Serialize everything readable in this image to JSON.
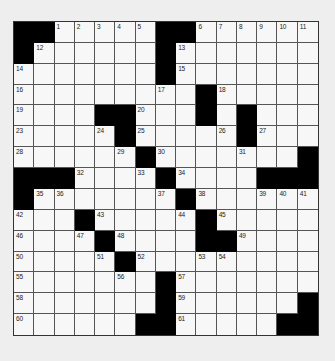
{
  "puzzle": {
    "rows": 15,
    "cols": 15,
    "colors": {
      "block": "#000000",
      "cell": "#f7f7f7",
      "line": "#555555",
      "background": "#eeeeee"
    },
    "grid": [
      "##.....##......",
      "#......#.......",
      ".......#.......",
      ".........#.....",
      "....##...#.#...",
      ".....#.....#...",
      "......#.......#",
      "###....#....###",
      "#.......#......",
      "...#.....#.....",
      "....#....##....",
      ".....#.........",
      ".......#.......",
      ".......#......#",
      "......##.....##"
    ],
    "numbers": [
      {
        "r": 0,
        "c": 2,
        "n": "1"
      },
      {
        "r": 0,
        "c": 3,
        "n": "2"
      },
      {
        "r": 0,
        "c": 4,
        "n": "3"
      },
      {
        "r": 0,
        "c": 5,
        "n": "4"
      },
      {
        "r": 0,
        "c": 6,
        "n": "5"
      },
      {
        "r": 0,
        "c": 9,
        "n": "6"
      },
      {
        "r": 0,
        "c": 10,
        "n": "7"
      },
      {
        "r": 0,
        "c": 11,
        "n": "8"
      },
      {
        "r": 0,
        "c": 12,
        "n": "9"
      },
      {
        "r": 0,
        "c": 13,
        "n": "10"
      },
      {
        "r": 0,
        "c": 14,
        "n": "11"
      },
      {
        "r": 1,
        "c": 1,
        "n": "12"
      },
      {
        "r": 1,
        "c": 8,
        "n": "13"
      },
      {
        "r": 2,
        "c": 0,
        "n": "14"
      },
      {
        "r": 2,
        "c": 8,
        "n": "15"
      },
      {
        "r": 3,
        "c": 0,
        "n": "16"
      },
      {
        "r": 3,
        "c": 7,
        "n": "17"
      },
      {
        "r": 3,
        "c": 10,
        "n": "18"
      },
      {
        "r": 4,
        "c": 0,
        "n": "19"
      },
      {
        "r": 4,
        "c": 6,
        "n": "20"
      },
      {
        "r": 4,
        "c": 9,
        "n": "21"
      },
      {
        "r": 4,
        "c": 11,
        "n": "22"
      },
      {
        "r": 5,
        "c": 0,
        "n": "23"
      },
      {
        "r": 5,
        "c": 4,
        "n": "24"
      },
      {
        "r": 5,
        "c": 6,
        "n": "25"
      },
      {
        "r": 5,
        "c": 10,
        "n": "26"
      },
      {
        "r": 5,
        "c": 12,
        "n": "27"
      },
      {
        "r": 6,
        "c": 0,
        "n": "28"
      },
      {
        "r": 6,
        "c": 5,
        "n": "29"
      },
      {
        "r": 6,
        "c": 7,
        "n": "30"
      },
      {
        "r": 6,
        "c": 11,
        "n": "31"
      },
      {
        "r": 7,
        "c": 3,
        "n": "32"
      },
      {
        "r": 7,
        "c": 6,
        "n": "33"
      },
      {
        "r": 7,
        "c": 8,
        "n": "34"
      },
      {
        "r": 8,
        "c": 1,
        "n": "35"
      },
      {
        "r": 8,
        "c": 2,
        "n": "36"
      },
      {
        "r": 8,
        "c": 7,
        "n": "37"
      },
      {
        "r": 8,
        "c": 9,
        "n": "38"
      },
      {
        "r": 8,
        "c": 12,
        "n": "39"
      },
      {
        "r": 8,
        "c": 13,
        "n": "40"
      },
      {
        "r": 8,
        "c": 14,
        "n": "41"
      },
      {
        "r": 9,
        "c": 0,
        "n": "42"
      },
      {
        "r": 9,
        "c": 4,
        "n": "43"
      },
      {
        "r": 9,
        "c": 8,
        "n": "44"
      },
      {
        "r": 9,
        "c": 10,
        "n": "45"
      },
      {
        "r": 10,
        "c": 0,
        "n": "46"
      },
      {
        "r": 10,
        "c": 3,
        "n": "47"
      },
      {
        "r": 10,
        "c": 5,
        "n": "48"
      },
      {
        "r": 10,
        "c": 11,
        "n": "49"
      },
      {
        "r": 11,
        "c": 0,
        "n": "50"
      },
      {
        "r": 11,
        "c": 4,
        "n": "51"
      },
      {
        "r": 11,
        "c": 6,
        "n": "52"
      },
      {
        "r": 11,
        "c": 9,
        "n": "53"
      },
      {
        "r": 11,
        "c": 10,
        "n": "54"
      },
      {
        "r": 12,
        "c": 0,
        "n": "55"
      },
      {
        "r": 12,
        "c": 5,
        "n": "56"
      },
      {
        "r": 12,
        "c": 8,
        "n": "57"
      },
      {
        "r": 13,
        "c": 0,
        "n": "58"
      },
      {
        "r": 13,
        "c": 8,
        "n": "59"
      },
      {
        "r": 14,
        "c": 0,
        "n": "60"
      },
      {
        "r": 14,
        "c": 8,
        "n": "61"
      }
    ]
  }
}
